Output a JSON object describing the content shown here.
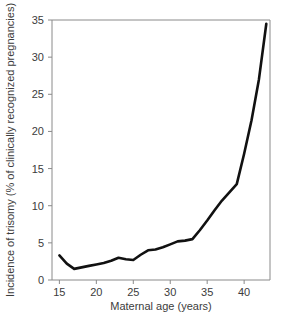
{
  "chart_data": {
    "type": "line",
    "title": "",
    "xlabel": "Maternal age (years)",
    "ylabel": "Incidence of trisomy (% of clinically recognized pregnancies)",
    "xlim": [
      14,
      43.5
    ],
    "ylim": [
      0,
      35
    ],
    "grid": false,
    "legend": null,
    "xticks": [
      15,
      20,
      25,
      30,
      35,
      40
    ],
    "xtick_labels": [
      "15",
      "20",
      "25",
      "30",
      "35",
      "40"
    ],
    "yticks": [
      0,
      5,
      10,
      15,
      20,
      25,
      30,
      35
    ],
    "ytick_labels": [
      "0",
      "5",
      "10",
      "15",
      "20",
      "25",
      "30",
      "35"
    ],
    "series": [
      {
        "name": "Incidence of trisomy",
        "color": "#111111",
        "x": [
          15,
          16,
          17,
          18,
          19,
          20,
          21,
          22,
          23,
          24,
          25,
          26,
          27,
          28,
          29,
          30,
          31,
          32,
          33,
          34,
          35,
          36,
          37,
          38,
          39,
          40,
          41,
          42,
          43
        ],
        "values": [
          3.3,
          2.2,
          1.5,
          1.7,
          1.9,
          2.1,
          2.3,
          2.6,
          3.0,
          2.8,
          2.7,
          3.4,
          4.0,
          4.1,
          4.4,
          4.8,
          5.2,
          5.3,
          5.5,
          6.7,
          8.0,
          9.4,
          10.7,
          11.8,
          12.9,
          17.0,
          21.5,
          27.0,
          34.5
        ]
      }
    ]
  },
  "axes": {
    "x_axis_name": "maternal-age-axis",
    "y_axis_name": "trisomy-incidence-axis"
  },
  "colors": {
    "line": "#111111",
    "frame": "#8a8a8a",
    "text": "#3c3c3c",
    "background": "#ffffff"
  }
}
